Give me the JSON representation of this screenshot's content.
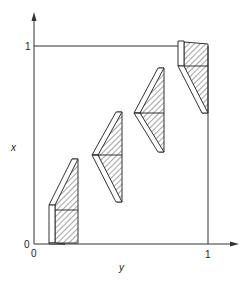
{
  "figure": {
    "axes": {
      "x_axis_label": "y",
      "y_axis_label": "x",
      "x_origin_label": "0",
      "y_origin_label": "0",
      "x_max_label": "1",
      "y_max_label": "1"
    },
    "colors": {
      "line": "#333333",
      "hatch": "#333333",
      "background": "#ffffff"
    },
    "shapes": [
      {
        "name": "shape-1",
        "description": "hatched trapezoid with vertical white strip at bottom-left"
      },
      {
        "name": "shape-2",
        "description": "hatched chevron pointing left"
      },
      {
        "name": "shape-3",
        "description": "hatched chevron pointing left"
      },
      {
        "name": "shape-4",
        "description": "hatched trapezoid with vertical white strip at top-left"
      }
    ]
  }
}
